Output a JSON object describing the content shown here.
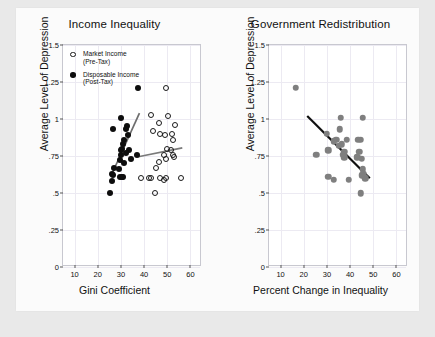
{
  "figure": {
    "background": "#e9e9e9",
    "paper_background": "#fbfbfb"
  },
  "panels": [
    {
      "id": "income-inequality",
      "title": "Income Inequality",
      "xlabel": "Gini Coefficient",
      "ylabel": "Average Level of Depression"
    },
    {
      "id": "government-redistribution",
      "title": "Government Redistribution",
      "xlabel": "Percent Change in Inequality",
      "ylabel": "Average Level of Depression"
    }
  ],
  "legend": {
    "items": [
      {
        "marker": "open-circle",
        "line1": "Market Income",
        "line2": "(Pre-Tax)"
      },
      {
        "marker": "filled-circle",
        "line1": "Disposable Income",
        "line2": "(Post-Tax)"
      }
    ]
  },
  "axis": {
    "xticks": [
      "10",
      "20",
      "30",
      "40",
      "50",
      "60"
    ],
    "xtick_values": [
      10,
      20,
      30,
      40,
      50,
      60
    ],
    "yticks": [
      "0",
      ".25",
      ".5",
      ".75",
      "1",
      "1.25",
      "1.5"
    ],
    "ytick_values": [
      0,
      0.25,
      0.5,
      0.75,
      1,
      1.25,
      1.5
    ],
    "xlim": [
      5,
      65
    ],
    "ylim": [
      0,
      1.5
    ]
  },
  "colors": {
    "market_marker": "#1a1a1a",
    "disposable_marker": "#0d0d0d",
    "redistribution_marker": "#7f7f7f",
    "market_fit_line": "#7a7a7a",
    "disposable_fit_line": "#6e6e6e",
    "redistribution_fit_line": "#111111",
    "grid": "#eceaf2",
    "axis_frame": "#c8c8d0"
  },
  "chart_data": [
    {
      "type": "scatter",
      "title": "Income Inequality",
      "xlabel": "Gini Coefficient",
      "ylabel": "Average Level of Depression",
      "xlim": [
        5,
        65
      ],
      "ylim": [
        0,
        1.5
      ],
      "grid": true,
      "legend_position": "top-left-inside",
      "series": [
        {
          "name": "Market Income (Pre-Tax)",
          "marker": "open-circle",
          "color": "#1a1a1a",
          "points": [
            [
              49.5,
              1.21
            ],
            [
              43.0,
              1.03
            ],
            [
              46.5,
              0.97
            ],
            [
              50.5,
              1.02
            ],
            [
              53.5,
              0.96
            ],
            [
              44.0,
              0.92
            ],
            [
              47.0,
              0.9
            ],
            [
              49.0,
              0.89
            ],
            [
              52.0,
              0.9
            ],
            [
              52.5,
              0.86
            ],
            [
              50.0,
              0.8
            ],
            [
              51.5,
              0.79
            ],
            [
              52.5,
              0.76
            ],
            [
              53.0,
              0.74
            ],
            [
              48.5,
              0.76
            ],
            [
              49.5,
              0.73
            ],
            [
              46.5,
              0.71
            ],
            [
              45.0,
              0.67
            ],
            [
              38.5,
              0.6
            ],
            [
              42.0,
              0.6
            ],
            [
              43.0,
              0.6
            ],
            [
              47.0,
              0.6
            ],
            [
              48.5,
              0.59
            ],
            [
              49.5,
              0.6
            ],
            [
              56.0,
              0.6
            ],
            [
              44.5,
              0.5
            ]
          ],
          "fit_line": {
            "x": [
              37.5,
              56.5
            ],
            "y": [
              0.745,
              0.805
            ],
            "color": "#7a7a7a"
          }
        },
        {
          "name": "Disposable Income (Post-Tax)",
          "marker": "filled-circle",
          "color": "#0d0d0d",
          "points": [
            [
              37.5,
              1.21
            ],
            [
              30.0,
              1.01
            ],
            [
              26.5,
              0.93
            ],
            [
              32.5,
              0.95
            ],
            [
              32.0,
              0.93
            ],
            [
              33.0,
              0.89
            ],
            [
              31.5,
              0.86
            ],
            [
              31.0,
              0.83
            ],
            [
              30.5,
              0.8
            ],
            [
              30.0,
              0.79
            ],
            [
              33.5,
              0.79
            ],
            [
              32.0,
              0.77
            ],
            [
              30.0,
              0.76
            ],
            [
              37.0,
              0.76
            ],
            [
              34.5,
              0.73
            ],
            [
              29.5,
              0.72
            ],
            [
              31.5,
              0.7
            ],
            [
              27.0,
              0.67
            ],
            [
              29.0,
              0.66
            ],
            [
              26.0,
              0.63
            ],
            [
              26.5,
              0.62
            ],
            [
              29.5,
              0.61
            ],
            [
              30.5,
              0.61
            ],
            [
              31.0,
              0.61
            ],
            [
              26.0,
              0.58
            ],
            [
              25.5,
              0.5
            ]
          ],
          "fit_line": {
            "x": [
              26.0,
              38.0
            ],
            "y": [
              0.625,
              1.04
            ],
            "color": "#6e6e6e"
          }
        }
      ]
    },
    {
      "type": "scatter",
      "title": "Government Redistribution",
      "xlabel": "Percent Change in Inequality",
      "ylabel": "Average Level of Depression",
      "xlim": [
        5,
        65
      ],
      "ylim": [
        0,
        1.5
      ],
      "grid": true,
      "legend_position": "none",
      "series": [
        {
          "name": "Redistribution",
          "marker": "filled-circle",
          "color": "#7f7f7f",
          "points": [
            [
              16.5,
              1.21
            ],
            [
              36.0,
              1.01
            ],
            [
              45.5,
              1.01
            ],
            [
              35.5,
              0.93
            ],
            [
              30.0,
              0.9
            ],
            [
              34.0,
              0.86
            ],
            [
              38.5,
              0.86
            ],
            [
              44.5,
              0.86
            ],
            [
              43.5,
              0.86
            ],
            [
              33.0,
              0.85
            ],
            [
              36.5,
              0.83
            ],
            [
              35.0,
              0.82
            ],
            [
              30.5,
              0.79
            ],
            [
              37.5,
              0.78
            ],
            [
              44.0,
              0.78
            ],
            [
              37.0,
              0.76
            ],
            [
              37.5,
              0.74
            ],
            [
              25.5,
              0.76
            ],
            [
              43.0,
              0.74
            ],
            [
              45.0,
              0.73
            ],
            [
              45.5,
              0.66
            ],
            [
              46.0,
              0.63
            ],
            [
              46.5,
              0.6
            ],
            [
              45.0,
              0.62
            ],
            [
              30.5,
              0.61
            ],
            [
              33.0,
              0.59
            ],
            [
              39.5,
              0.59
            ],
            [
              44.5,
              0.5
            ]
          ],
          "fit_line": {
            "x": [
              21.5,
              48.5
            ],
            "y": [
              1.02,
              0.6
            ],
            "color": "#111111"
          }
        }
      ]
    }
  ]
}
